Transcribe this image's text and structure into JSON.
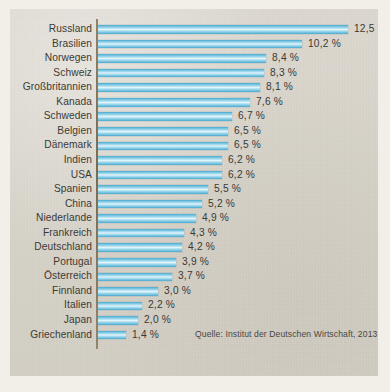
{
  "chart_data": {
    "type": "bar",
    "orientation": "horizontal",
    "title": "",
    "subtitle": "",
    "xlabel": "",
    "ylabel": "",
    "xlim": [
      0,
      13
    ],
    "grid": false,
    "legend": null,
    "value_suffix": " %",
    "decimal_separator": ",",
    "categories": [
      "Russland",
      "Brasilien",
      "Norwegen",
      "Schweiz",
      "Großbritannien",
      "Kanada",
      "Schweden",
      "Belgien",
      "Dänemark",
      "Indien",
      "USA",
      "Spanien",
      "China",
      "Niederlande",
      "Frankreich",
      "Deutschland",
      "Portugal",
      "Österreich",
      "Finnland",
      "Italien",
      "Japan",
      "Griechenland"
    ],
    "values": [
      12.5,
      10.2,
      8.4,
      8.3,
      8.1,
      7.6,
      6.7,
      6.5,
      6.5,
      6.2,
      6.2,
      5.5,
      5.2,
      4.9,
      4.3,
      4.2,
      3.9,
      3.7,
      3.0,
      2.2,
      2.0,
      1.4
    ],
    "value_labels": [
      "12,5 %",
      "10,2 %",
      "8,4 %",
      "8,3 %",
      "8,1 %",
      "7,6 %",
      "6,7 %",
      "6,5 %",
      "6,5 %",
      "6,2 %",
      "6,2 %",
      "5,5 %",
      "5,2 %",
      "4,9 %",
      "4,3 %",
      "4,2 %",
      "3,9 %",
      "3,7 %",
      "3,0 %",
      "2,2 %",
      "2,0 %",
      "1,4 %"
    ],
    "bar_color": "#7ec8e3",
    "source": "Quelle: Institut der Deutschen Wirtschaft, 2013"
  },
  "colors": {
    "page_background": "#f2efe8",
    "panel_background": "#d9d5cb",
    "bar_accent": "#7ec8e3",
    "axis": "#7a6c52",
    "text": "#3c3a35"
  }
}
